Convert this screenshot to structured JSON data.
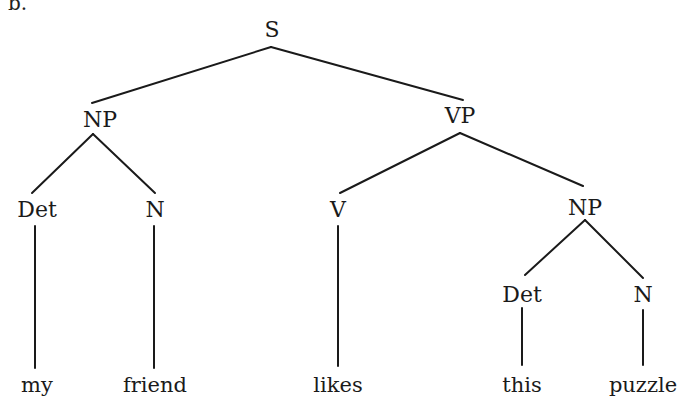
{
  "figure": {
    "corner_label_fragment": "b.",
    "line_color": "#1a1a1a",
    "text_color": "#1a1a1a",
    "background": "#ffffff"
  },
  "tree": {
    "root": "S",
    "nodes": {
      "s": {
        "label": "S",
        "x": 272,
        "y": 30
      },
      "np_subject": {
        "label": "NP",
        "x": 100,
        "y": 120
      },
      "vp": {
        "label": "VP",
        "x": 460,
        "y": 116
      },
      "det_subject": {
        "label": "Det",
        "x": 37,
        "y": 210
      },
      "n_subject": {
        "label": "N",
        "x": 155,
        "y": 210
      },
      "v": {
        "label": "V",
        "x": 338,
        "y": 210
      },
      "np_object": {
        "label": "NP",
        "x": 585,
        "y": 208
      },
      "det_object": {
        "label": "Det",
        "x": 522,
        "y": 295
      },
      "n_object": {
        "label": "N",
        "x": 643,
        "y": 295
      }
    },
    "leaves": [
      {
        "word": "my",
        "x": 37,
        "y": 385
      },
      {
        "word": "friend",
        "x": 155,
        "y": 385
      },
      {
        "word": "likes",
        "x": 338,
        "y": 385
      },
      {
        "word": "this",
        "x": 522,
        "y": 385
      },
      {
        "word": "puzzle",
        "x": 643,
        "y": 385
      }
    ],
    "edges": [
      {
        "from": "S",
        "to": "NP",
        "x1": 271,
        "y1": 47,
        "x2": 92,
        "y2": 103
      },
      {
        "from": "S",
        "to": "VP",
        "x1": 271,
        "y1": 47,
        "x2": 463,
        "y2": 100
      },
      {
        "from": "NP",
        "to": "Det",
        "x1": 93,
        "y1": 134,
        "x2": 32,
        "y2": 193
      },
      {
        "from": "NP",
        "to": "N",
        "x1": 93,
        "y1": 134,
        "x2": 155,
        "y2": 193
      },
      {
        "from": "VP",
        "to": "V",
        "x1": 460,
        "y1": 133,
        "x2": 340,
        "y2": 193
      },
      {
        "from": "VP",
        "to": "NP",
        "x1": 460,
        "y1": 133,
        "x2": 583,
        "y2": 186
      },
      {
        "from": "NP",
        "to": "Det",
        "x1": 585,
        "y1": 220,
        "x2": 525,
        "y2": 275
      },
      {
        "from": "NP",
        "to": "N",
        "x1": 585,
        "y1": 220,
        "x2": 643,
        "y2": 278
      },
      {
        "from": "Det",
        "to": "my",
        "x1": 35,
        "y1": 226,
        "x2": 35,
        "y2": 368
      },
      {
        "from": "N",
        "to": "friend",
        "x1": 154,
        "y1": 226,
        "x2": 154,
        "y2": 368
      },
      {
        "from": "V",
        "to": "likes",
        "x1": 338,
        "y1": 226,
        "x2": 338,
        "y2": 366
      },
      {
        "from": "Det",
        "to": "this",
        "x1": 522,
        "y1": 308,
        "x2": 522,
        "y2": 365
      },
      {
        "from": "N",
        "to": "puzzle",
        "x1": 643,
        "y1": 310,
        "x2": 643,
        "y2": 365
      }
    ]
  }
}
